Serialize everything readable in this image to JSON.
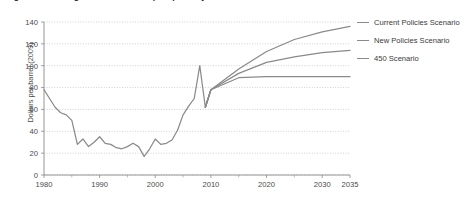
{
  "figure": {
    "title_clipped": "Figure 1.4  Average IEA crude oil import price by scenario",
    "ylabel": "Dollars per barrel (2009)"
  },
  "legend": {
    "position": "right",
    "items": [
      {
        "label": "Current Policies Scenario",
        "color": "#8a8a8a"
      },
      {
        "label": "New Policies Scenario",
        "color": "#8a8a8a"
      },
      {
        "label": "450 Scenario",
        "color": "#8a8a8a"
      }
    ]
  },
  "axes": {
    "y_ticks": [
      0,
      20,
      40,
      60,
      80,
      100,
      120,
      140
    ],
    "x_ticks": [
      1980,
      1990,
      2000,
      2010,
      2020,
      2030,
      2035
    ],
    "x_minor_ticks": [
      1985,
      1995,
      2005,
      2015,
      2025
    ],
    "xlim": [
      1980,
      2035
    ],
    "ylim": [
      0,
      140
    ],
    "grid": "horizontal-dotted"
  },
  "chart_data": {
    "type": "line",
    "title": "Average IEA crude oil import price by scenario",
    "xlabel": "",
    "ylabel": "Dollars per barrel (2009)",
    "xlim": [
      1980,
      2035
    ],
    "ylim": [
      0,
      140
    ],
    "grid": true,
    "legend_position": "right",
    "series": [
      {
        "name": "Historical",
        "color": "#8a8a8a",
        "x": [
          1980,
          1981,
          1982,
          1983,
          1984,
          1985,
          1986,
          1987,
          1988,
          1989,
          1990,
          1991,
          1992,
          1993,
          1994,
          1995,
          1996,
          1997,
          1998,
          1999,
          2000,
          2001,
          2002,
          2003,
          2004,
          2005,
          2006,
          2007,
          2008,
          2009,
          2010
        ],
        "values": [
          78,
          70,
          62,
          57,
          55,
          50,
          28,
          33,
          26,
          30,
          35,
          29,
          28,
          25,
          24,
          26,
          29,
          26,
          17,
          24,
          33,
          28,
          29,
          32,
          41,
          55,
          63,
          70,
          100,
          62,
          78
        ]
      },
      {
        "name": "Current Policies Scenario",
        "color": "#8a8a8a",
        "x": [
          2009,
          2010,
          2015,
          2020,
          2025,
          2030,
          2035
        ],
        "values": [
          62,
          78,
          97,
          113,
          124,
          131,
          136
        ]
      },
      {
        "name": "New Policies Scenario",
        "color": "#8a8a8a",
        "x": [
          2009,
          2010,
          2015,
          2020,
          2025,
          2030,
          2035
        ],
        "values": [
          62,
          78,
          93,
          103,
          108,
          112,
          114
        ]
      },
      {
        "name": "450 Scenario",
        "color": "#8a8a8a",
        "x": [
          2009,
          2010,
          2015,
          2020,
          2025,
          2030,
          2035
        ],
        "values": [
          62,
          78,
          89,
          90,
          90,
          90,
          90
        ]
      }
    ]
  }
}
